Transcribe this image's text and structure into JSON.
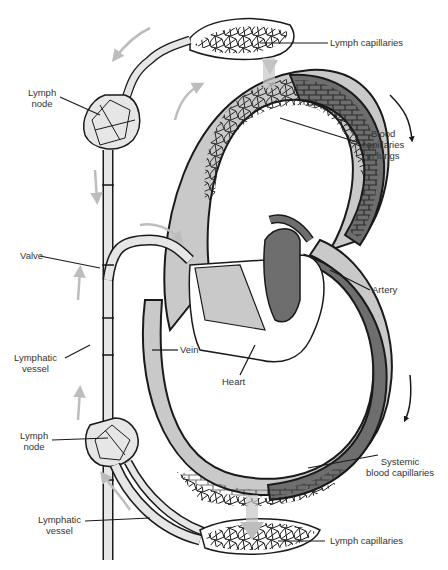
{
  "diagram": {
    "colors": {
      "background": "#ffffff",
      "outline": "#1a1a1a",
      "lymph_fill": "#e6e6e6",
      "vein_fill": "#c9c9c9",
      "artery_fill": "#6e6e6e",
      "flow_arrow": "#bdbdbd",
      "label_text": "#333333"
    },
    "labels": {
      "lymph_capillaries_top": "Lymph capillaries",
      "lymph_node_top_line1": "Lymph",
      "lymph_node_top_line2": "node",
      "blood_capillaries_lungs_line1": "Blood",
      "blood_capillaries_lungs_line2": "capillaries",
      "blood_capillaries_lungs_line3": "in lungs",
      "valve": "Valve",
      "artery": "Artery",
      "vein": "Vein",
      "heart": "Heart",
      "lymphatic_vessel_mid_line1": "Lymphatic",
      "lymphatic_vessel_mid_line2": "vessel",
      "lymph_node_bottom_line1": "Lymph",
      "lymph_node_bottom_line2": "node",
      "systemic_capillaries_line1": "Systemic",
      "systemic_capillaries_line2": "blood capillaries",
      "lymphatic_vessel_bottom_line1": "Lymphatic",
      "lymphatic_vessel_bottom_line2": "vessel",
      "lymph_capillaries_bottom": "Lymph capillaries"
    }
  }
}
